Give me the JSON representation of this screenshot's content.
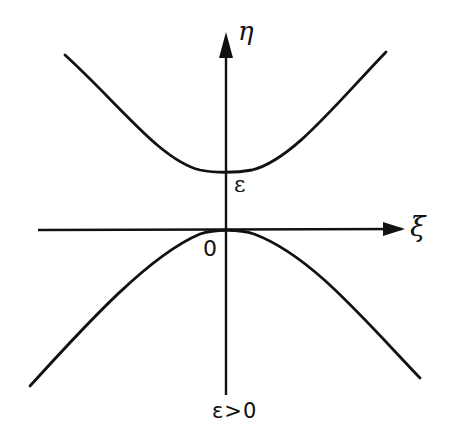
{
  "diagram": {
    "type": "phase-plane sketch of hyperbola branches",
    "axes": {
      "horizontal": {
        "label": "ξ",
        "arrow": "right"
      },
      "vertical": {
        "label": "η",
        "arrow": "up"
      }
    },
    "labels": {
      "eta": "η",
      "xi": "ξ",
      "epsilon_mark": "ε",
      "origin": "0",
      "condition": "ε>0"
    },
    "curves": [
      {
        "name": "upper-branch",
        "description": "Upper hyperbola branch, opening upward, vertex at η = ε on vertical axis"
      },
      {
        "name": "lower-branch",
        "description": "Lower hyperbola branch, opening downward, touching the origin 0"
      }
    ],
    "colors": {
      "ink": "#111111",
      "background": "#ffffff"
    }
  }
}
